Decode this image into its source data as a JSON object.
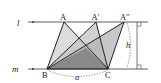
{
  "diagram": {
    "lines": {
      "l": {
        "label": "l",
        "y": 22
      },
      "m": {
        "label": "m",
        "y": 69
      }
    },
    "points": {
      "A": {
        "label": "A",
        "x": 64,
        "y": 22
      },
      "A_prime": {
        "label": "A′",
        "x": 96,
        "y": 22
      },
      "A_double_prime": {
        "label": "A″",
        "x": 124,
        "y": 22
      },
      "B": {
        "label": "B",
        "x": 47,
        "y": 69
      },
      "C": {
        "label": "C",
        "x": 108,
        "y": 69
      }
    },
    "measures": {
      "base": {
        "label": "a"
      },
      "height": {
        "label": "h"
      }
    },
    "triangles": [
      {
        "name": "ABC",
        "fill": "#d9d9d9"
      },
      {
        "name": "A′BC",
        "fill": "#b8b8b8"
      },
      {
        "name": "A″BC",
        "fill": "#a0a0a0"
      }
    ],
    "colors": {
      "stroke": "#222222",
      "overlap_dark": "#7a7a7a"
    }
  }
}
